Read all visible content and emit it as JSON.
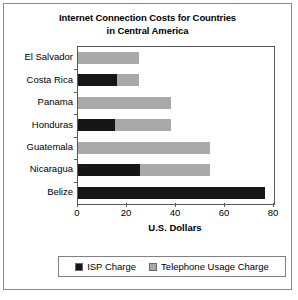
{
  "chart_data": {
    "type": "bar",
    "orientation": "horizontal",
    "stacked": true,
    "title": "Internet Connection Costs for Countries in Central America",
    "title_lines": [
      "Internet Connection Costs for Countries",
      "in Central America"
    ],
    "categories": [
      "El Salvador",
      "Costa Rica",
      "Panama",
      "Honduras",
      "Guatemala",
      "Nicaragua",
      "Belize"
    ],
    "series": [
      {
        "name": "ISP Charge",
        "color": "#161616",
        "values": [
          0,
          16,
          0,
          15,
          0,
          25.5,
          76.5
        ]
      },
      {
        "name": "Telephone Usage Charge",
        "color": "#a9a9a9",
        "values": [
          25,
          9,
          38,
          23,
          54,
          28.5,
          0
        ]
      }
    ],
    "totals": [
      25,
      25,
      38,
      38,
      54,
      54,
      76.5
    ],
    "xlabel": "U.S. Dollars",
    "ylabel": "",
    "xlim": [
      0,
      80
    ],
    "xticks": [
      0,
      20,
      40,
      60,
      80
    ],
    "xtick_labels": [
      "0",
      "20",
      "40",
      "60",
      "80"
    ],
    "grid": false,
    "legend_position": "bottom"
  },
  "legend": {
    "entries": [
      {
        "label": "ISP Charge",
        "color": "#161616"
      },
      {
        "label": "Telephone Usage Charge",
        "color": "#a9a9a9"
      }
    ]
  }
}
